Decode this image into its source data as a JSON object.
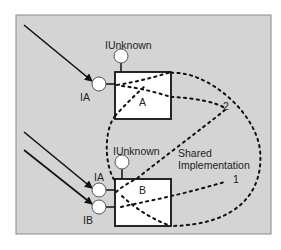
{
  "diagram": {
    "title": "",
    "colors": {
      "panel": "#d4d4d4",
      "panel_border": "#8a8a8a",
      "box_fill": "#ffffff",
      "stroke": "#111111",
      "interface_fill": "#ffffff"
    },
    "components": [
      {
        "id": "A",
        "label": "A",
        "interfaces": [
          {
            "name": "IUnknown",
            "position": "top"
          },
          {
            "name": "IA",
            "position": "left"
          }
        ]
      },
      {
        "id": "B",
        "label": "B",
        "interfaces": [
          {
            "name": "IUnknown",
            "position": "top"
          },
          {
            "name": "IA",
            "position": "left"
          },
          {
            "name": "IB",
            "position": "left"
          }
        ]
      }
    ],
    "labels": {
      "a_iunknown": "IUnknown",
      "a_ia": "IA",
      "box_a": "A",
      "b_iunknown": "IUnknown",
      "b_ia": "IA",
      "b_ib": "IB",
      "box_b": "B",
      "shared_implementation": "Shared\nImplementation",
      "num_1": "1",
      "num_2": "2"
    },
    "edges": [
      {
        "from": "client",
        "to": "A.IA",
        "style": "arrow"
      },
      {
        "from": "client",
        "to": "B.IA",
        "style": "arrow"
      },
      {
        "from": "client",
        "to": "B.IB",
        "style": "arrow"
      },
      {
        "from": "A",
        "to": "B",
        "style": "dotted",
        "note": "Shared Implementation"
      },
      {
        "label": "1",
        "style": "dotted"
      },
      {
        "label": "2",
        "style": "dotted"
      }
    ]
  }
}
